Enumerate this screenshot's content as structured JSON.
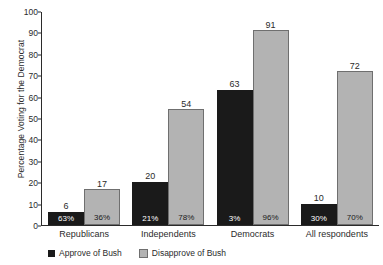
{
  "chart_data": {
    "type": "bar",
    "title": "",
    "xlabel": "",
    "ylabel": "Percentage Voting for the Democrat",
    "ylim": [
      0,
      100
    ],
    "yticks": [
      0,
      10,
      20,
      30,
      40,
      50,
      60,
      70,
      80,
      90,
      100
    ],
    "grid": false,
    "legend_position": "bottom-left",
    "categories": [
      "Republicans",
      "Independents",
      "Democrats",
      "All respondents"
    ],
    "series": [
      {
        "name": "Approve of Bush",
        "color": "#1a1a1a",
        "values": [
          6,
          20,
          63,
          10
        ],
        "share_labels": [
          "63%",
          "21%",
          "3%",
          "30%"
        ]
      },
      {
        "name": "Disapprove of Bush",
        "color": "#b3b3b3",
        "values": [
          17,
          54,
          91,
          72
        ],
        "share_labels": [
          "36%",
          "78%",
          "96%",
          "70%"
        ]
      }
    ]
  },
  "legend": {
    "items": [
      {
        "label": "Approve of Bush"
      },
      {
        "label": "Disapprove of Bush"
      }
    ]
  }
}
